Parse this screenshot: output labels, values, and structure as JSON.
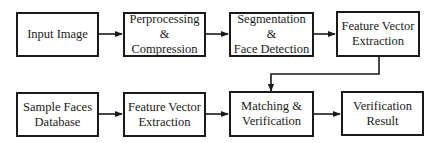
{
  "diagram": {
    "type": "flowchart",
    "rows": [
      {
        "nodes": [
          {
            "id": "input_image",
            "label": "Input Image"
          },
          {
            "id": "preprocessing",
            "label": "Perprocessing\n& Compression"
          },
          {
            "id": "segmentation",
            "label": "Segmentation &\nFace Detection"
          },
          {
            "id": "feature_extraction_1",
            "label": "Feature Vector\nExtraction"
          }
        ]
      },
      {
        "nodes": [
          {
            "id": "sample_faces_db",
            "label": "Sample Faces\nDatabase"
          },
          {
            "id": "feature_extraction_2",
            "label": "Feature Vector\nExtraction"
          },
          {
            "id": "matching",
            "label": "Matching &\nVerification"
          },
          {
            "id": "verification_result",
            "label": "Verification\nResult"
          }
        ]
      }
    ],
    "edges": [
      {
        "from": "input_image",
        "to": "preprocessing"
      },
      {
        "from": "preprocessing",
        "to": "segmentation"
      },
      {
        "from": "segmentation",
        "to": "feature_extraction_1"
      },
      {
        "from": "feature_extraction_1",
        "to": "matching"
      },
      {
        "from": "sample_faces_db",
        "to": "feature_extraction_2"
      },
      {
        "from": "feature_extraction_2",
        "to": "matching"
      },
      {
        "from": "matching",
        "to": "verification_result"
      }
    ],
    "colors": {
      "stroke": "#1a1a1a",
      "fill": "#ffffff",
      "text": "#1a1a1a"
    }
  }
}
